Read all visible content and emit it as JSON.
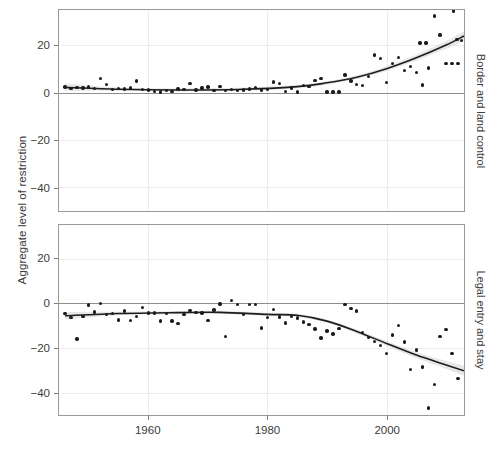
{
  "chart_data": {
    "type": "scatter",
    "title": "",
    "subtitle": "",
    "xlabel": "",
    "ylabel": "Aggregate level of restriction",
    "xlim": [
      1945,
      2013
    ],
    "ylim": [
      -50,
      35
    ],
    "xticks": [
      1960,
      1980,
      2000
    ],
    "xticklabels": [
      "1960",
      "1980",
      "2000"
    ],
    "yticks": [
      20,
      0,
      -20,
      -40
    ],
    "yticklabels": [
      "20",
      "0",
      "−20",
      "−40"
    ],
    "grid": true,
    "legend": null,
    "zero_reference_line": 0,
    "panels": [
      {
        "id": "border-and-land-control",
        "strip_label": "Border and land control",
        "ylim": [
          -50,
          35
        ],
        "points": [
          {
            "x": 1946,
            "y": 2.5
          },
          {
            "x": 1947,
            "y": 1.8
          },
          {
            "x": 1948,
            "y": 2.2
          },
          {
            "x": 1949,
            "y": 2.0
          },
          {
            "x": 1950,
            "y": 2.4
          },
          {
            "x": 1951,
            "y": 1.9
          },
          {
            "x": 1952,
            "y": 6.0
          },
          {
            "x": 1953,
            "y": 3.6
          },
          {
            "x": 1954,
            "y": 1.5
          },
          {
            "x": 1955,
            "y": 1.9
          },
          {
            "x": 1956,
            "y": 1.6
          },
          {
            "x": 1957,
            "y": 2.0
          },
          {
            "x": 1958,
            "y": 5.0
          },
          {
            "x": 1959,
            "y": 1.4
          },
          {
            "x": 1960,
            "y": 1.2
          },
          {
            "x": 1961,
            "y": 0.6
          },
          {
            "x": 1962,
            "y": 0.4
          },
          {
            "x": 1963,
            "y": 1.0
          },
          {
            "x": 1964,
            "y": 0.5
          },
          {
            "x": 1965,
            "y": 1.6
          },
          {
            "x": 1966,
            "y": 1.3
          },
          {
            "x": 1967,
            "y": 3.8
          },
          {
            "x": 1968,
            "y": 1.1
          },
          {
            "x": 1969,
            "y": 2.1
          },
          {
            "x": 1970,
            "y": 2.4
          },
          {
            "x": 1971,
            "y": 1.0
          },
          {
            "x": 1972,
            "y": 2.7
          },
          {
            "x": 1973,
            "y": 1.0
          },
          {
            "x": 1974,
            "y": 1.3
          },
          {
            "x": 1975,
            "y": 0.9
          },
          {
            "x": 1976,
            "y": 1.2
          },
          {
            "x": 1977,
            "y": 1.6
          },
          {
            "x": 1978,
            "y": 2.3
          },
          {
            "x": 1979,
            "y": 1.2
          },
          {
            "x": 1980,
            "y": 1.4
          },
          {
            "x": 1981,
            "y": 4.5
          },
          {
            "x": 1982,
            "y": 4.0
          },
          {
            "x": 1983,
            "y": 0.6
          },
          {
            "x": 1984,
            "y": 2.0
          },
          {
            "x": 1985,
            "y": 0.4
          },
          {
            "x": 1986,
            "y": 3.1
          },
          {
            "x": 1987,
            "y": 2.6
          },
          {
            "x": 1988,
            "y": 5.2
          },
          {
            "x": 1989,
            "y": 6.0
          },
          {
            "x": 1990,
            "y": 0.4
          },
          {
            "x": 1991,
            "y": 0.4
          },
          {
            "x": 1992,
            "y": 0.4
          },
          {
            "x": 1993,
            "y": 7.5
          },
          {
            "x": 1994,
            "y": 5.0
          },
          {
            "x": 1995,
            "y": 3.4
          },
          {
            "x": 1996,
            "y": 3.2
          },
          {
            "x": 1997,
            "y": 7.0
          },
          {
            "x": 1998,
            "y": 16.0
          },
          {
            "x": 1999,
            "y": 14.5
          },
          {
            "x": 2000,
            "y": 4.4
          },
          {
            "x": 2001,
            "y": 12.5
          },
          {
            "x": 2002,
            "y": 14.8
          },
          {
            "x": 2003,
            "y": 9.4
          },
          {
            "x": 2004,
            "y": 11.0
          },
          {
            "x": 2005,
            "y": 8.6
          },
          {
            "x": 2006,
            "y": 3.3
          },
          {
            "x": 2007,
            "y": 10.5
          },
          {
            "x": 2008,
            "y": 32.5
          },
          {
            "x": 2009,
            "y": 24.5
          },
          {
            "x": 2010,
            "y": 12.5
          },
          {
            "x": 2011,
            "y": 12.5
          },
          {
            "x": 2012,
            "y": 12.5
          },
          {
            "x": 2005.6,
            "y": 21.0
          },
          {
            "x": 2006.6,
            "y": 21.0
          },
          {
            "x": 2011.2,
            "y": 34.5
          },
          {
            "x": 2011.8,
            "y": 22.5
          },
          {
            "x": 2012.6,
            "y": 22.0
          }
        ],
        "fit_curve": [
          {
            "x": 1946,
            "y": 2.3
          },
          {
            "x": 1955,
            "y": 1.5
          },
          {
            "x": 1965,
            "y": 1.2
          },
          {
            "x": 1975,
            "y": 1.4
          },
          {
            "x": 1985,
            "y": 2.6
          },
          {
            "x": 1990,
            "y": 4.2
          },
          {
            "x": 1995,
            "y": 6.6
          },
          {
            "x": 2000,
            "y": 10.2
          },
          {
            "x": 2005,
            "y": 14.8
          },
          {
            "x": 2010,
            "y": 20.2
          },
          {
            "x": 2013,
            "y": 24.0
          }
        ],
        "fit_label": "loess smooth with confidence ribbon"
      },
      {
        "id": "legal-entry-and-stay",
        "strip_label": "Legal entry and stay",
        "ylim": [
          -50,
          35
        ],
        "points": [
          {
            "x": 1946,
            "y": -4.6
          },
          {
            "x": 1947,
            "y": -6.5
          },
          {
            "x": 1948,
            "y": -16.0
          },
          {
            "x": 1949,
            "y": -6.0
          },
          {
            "x": 1950,
            "y": -0.8
          },
          {
            "x": 1951,
            "y": -4.0
          },
          {
            "x": 1952,
            "y": -0.2
          },
          {
            "x": 1953,
            "y": -5.0
          },
          {
            "x": 1954,
            "y": -4.6
          },
          {
            "x": 1955,
            "y": -7.5
          },
          {
            "x": 1956,
            "y": -3.4
          },
          {
            "x": 1957,
            "y": -7.8
          },
          {
            "x": 1958,
            "y": -6.0
          },
          {
            "x": 1959,
            "y": -2.0
          },
          {
            "x": 1960,
            "y": -4.4
          },
          {
            "x": 1961,
            "y": -4.3
          },
          {
            "x": 1962,
            "y": -7.9
          },
          {
            "x": 1963,
            "y": -4.5
          },
          {
            "x": 1964,
            "y": -8.0
          },
          {
            "x": 1965,
            "y": -9.0
          },
          {
            "x": 1966,
            "y": -5.0
          },
          {
            "x": 1967,
            "y": -3.3
          },
          {
            "x": 1968,
            "y": -4.2
          },
          {
            "x": 1969,
            "y": -4.3
          },
          {
            "x": 1970,
            "y": -7.6
          },
          {
            "x": 1971,
            "y": -3.0
          },
          {
            "x": 1972,
            "y": -0.4
          },
          {
            "x": 1973,
            "y": -14.8
          },
          {
            "x": 1974,
            "y": 1.2
          },
          {
            "x": 1975,
            "y": -0.6
          },
          {
            "x": 1976,
            "y": -5.0
          },
          {
            "x": 1977,
            "y": -0.5
          },
          {
            "x": 1978,
            "y": -0.6
          },
          {
            "x": 1979,
            "y": -11.0
          },
          {
            "x": 1980,
            "y": -6.4
          },
          {
            "x": 1981,
            "y": -2.8
          },
          {
            "x": 1982,
            "y": -6.2
          },
          {
            "x": 1983,
            "y": -8.8
          },
          {
            "x": 1984,
            "y": -6.0
          },
          {
            "x": 1985,
            "y": -6.6
          },
          {
            "x": 1986,
            "y": -8.4
          },
          {
            "x": 1987,
            "y": -9.6
          },
          {
            "x": 1988,
            "y": -11.6
          },
          {
            "x": 1989,
            "y": -15.6
          },
          {
            "x": 1990,
            "y": -12.4
          },
          {
            "x": 1991,
            "y": -13.8
          },
          {
            "x": 1992,
            "y": -11.4
          },
          {
            "x": 1993,
            "y": -0.5
          },
          {
            "x": 1994,
            "y": -2.4
          },
          {
            "x": 1995,
            "y": -3.4
          },
          {
            "x": 1996,
            "y": -13.0
          },
          {
            "x": 1997,
            "y": -15.2
          },
          {
            "x": 1998,
            "y": -17.0
          },
          {
            "x": 1999,
            "y": -18.8
          },
          {
            "x": 2000,
            "y": -22.6
          },
          {
            "x": 2001,
            "y": -14.2
          },
          {
            "x": 2002,
            "y": -10.0
          },
          {
            "x": 2003,
            "y": -17.4
          },
          {
            "x": 2004,
            "y": -29.6
          },
          {
            "x": 2005,
            "y": -21.0
          },
          {
            "x": 2006,
            "y": -28.6
          },
          {
            "x": 2007,
            "y": -46.8
          },
          {
            "x": 2008,
            "y": -36.4
          },
          {
            "x": 2009,
            "y": -14.8
          },
          {
            "x": 2010,
            "y": -11.8
          },
          {
            "x": 2011,
            "y": -22.4
          },
          {
            "x": 2012,
            "y": -33.6
          }
        ],
        "fit_curve": [
          {
            "x": 1946,
            "y": -5.6
          },
          {
            "x": 1955,
            "y": -4.6
          },
          {
            "x": 1965,
            "y": -4.2
          },
          {
            "x": 1972,
            "y": -4.1
          },
          {
            "x": 1980,
            "y": -5.0
          },
          {
            "x": 1985,
            "y": -5.4
          },
          {
            "x": 1990,
            "y": -8.0
          },
          {
            "x": 1995,
            "y": -12.6
          },
          {
            "x": 2000,
            "y": -18.0
          },
          {
            "x": 2005,
            "y": -23.2
          },
          {
            "x": 2010,
            "y": -27.6
          },
          {
            "x": 2013,
            "y": -30.2
          }
        ],
        "fit_label": "loess smooth with confidence ribbon"
      }
    ],
    "colors": {
      "point": "#1b1b1b",
      "fit_line": "#1d1d1d",
      "ribbon": "#c9c9c9",
      "gridline": "#ececec",
      "panel_border": "#9a9a9a",
      "zero_line": "#8e8e8e",
      "text": "#3b3b3b",
      "background": "#ffffff"
    }
  }
}
